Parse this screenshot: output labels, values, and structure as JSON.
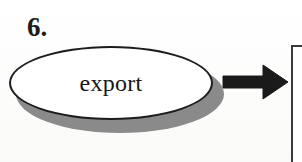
{
  "diagram": {
    "type": "flowchart-fragment",
    "step": {
      "number_label": "6."
    },
    "nodes": [
      {
        "shape": "ellipse",
        "label": "export",
        "fill_color": "#ffffff",
        "outline_color": "#1d1d1d",
        "shadow_color": "#8a8a8a",
        "text_color": "#161616"
      }
    ],
    "connectors": [
      {
        "kind": "arrow",
        "direction": "right",
        "color": "#1a1a1a"
      }
    ],
    "partial_shapes": [
      {
        "kind": "box-corner",
        "position": "right-edge",
        "border_color": "#3a3a3a"
      }
    ],
    "background_color": "#fdfdfc"
  }
}
